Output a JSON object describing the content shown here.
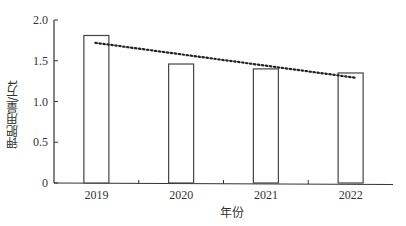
{
  "chart_data": {
    "type": "bar",
    "title": "",
    "xlabel": "年份",
    "ylabel": "钾肥用量/万t",
    "categories": [
      "2019",
      "2020",
      "2021",
      "2022"
    ],
    "values": [
      1.81,
      1.46,
      1.4,
      1.35
    ],
    "ylim": [
      0,
      2.0
    ],
    "yticks": [
      "0",
      "0.5",
      "1.0",
      "1.5",
      "2.0"
    ],
    "trendline": {
      "style": "dotted",
      "start": 1.72,
      "end": 1.29
    },
    "grid": false,
    "legend": null
  }
}
